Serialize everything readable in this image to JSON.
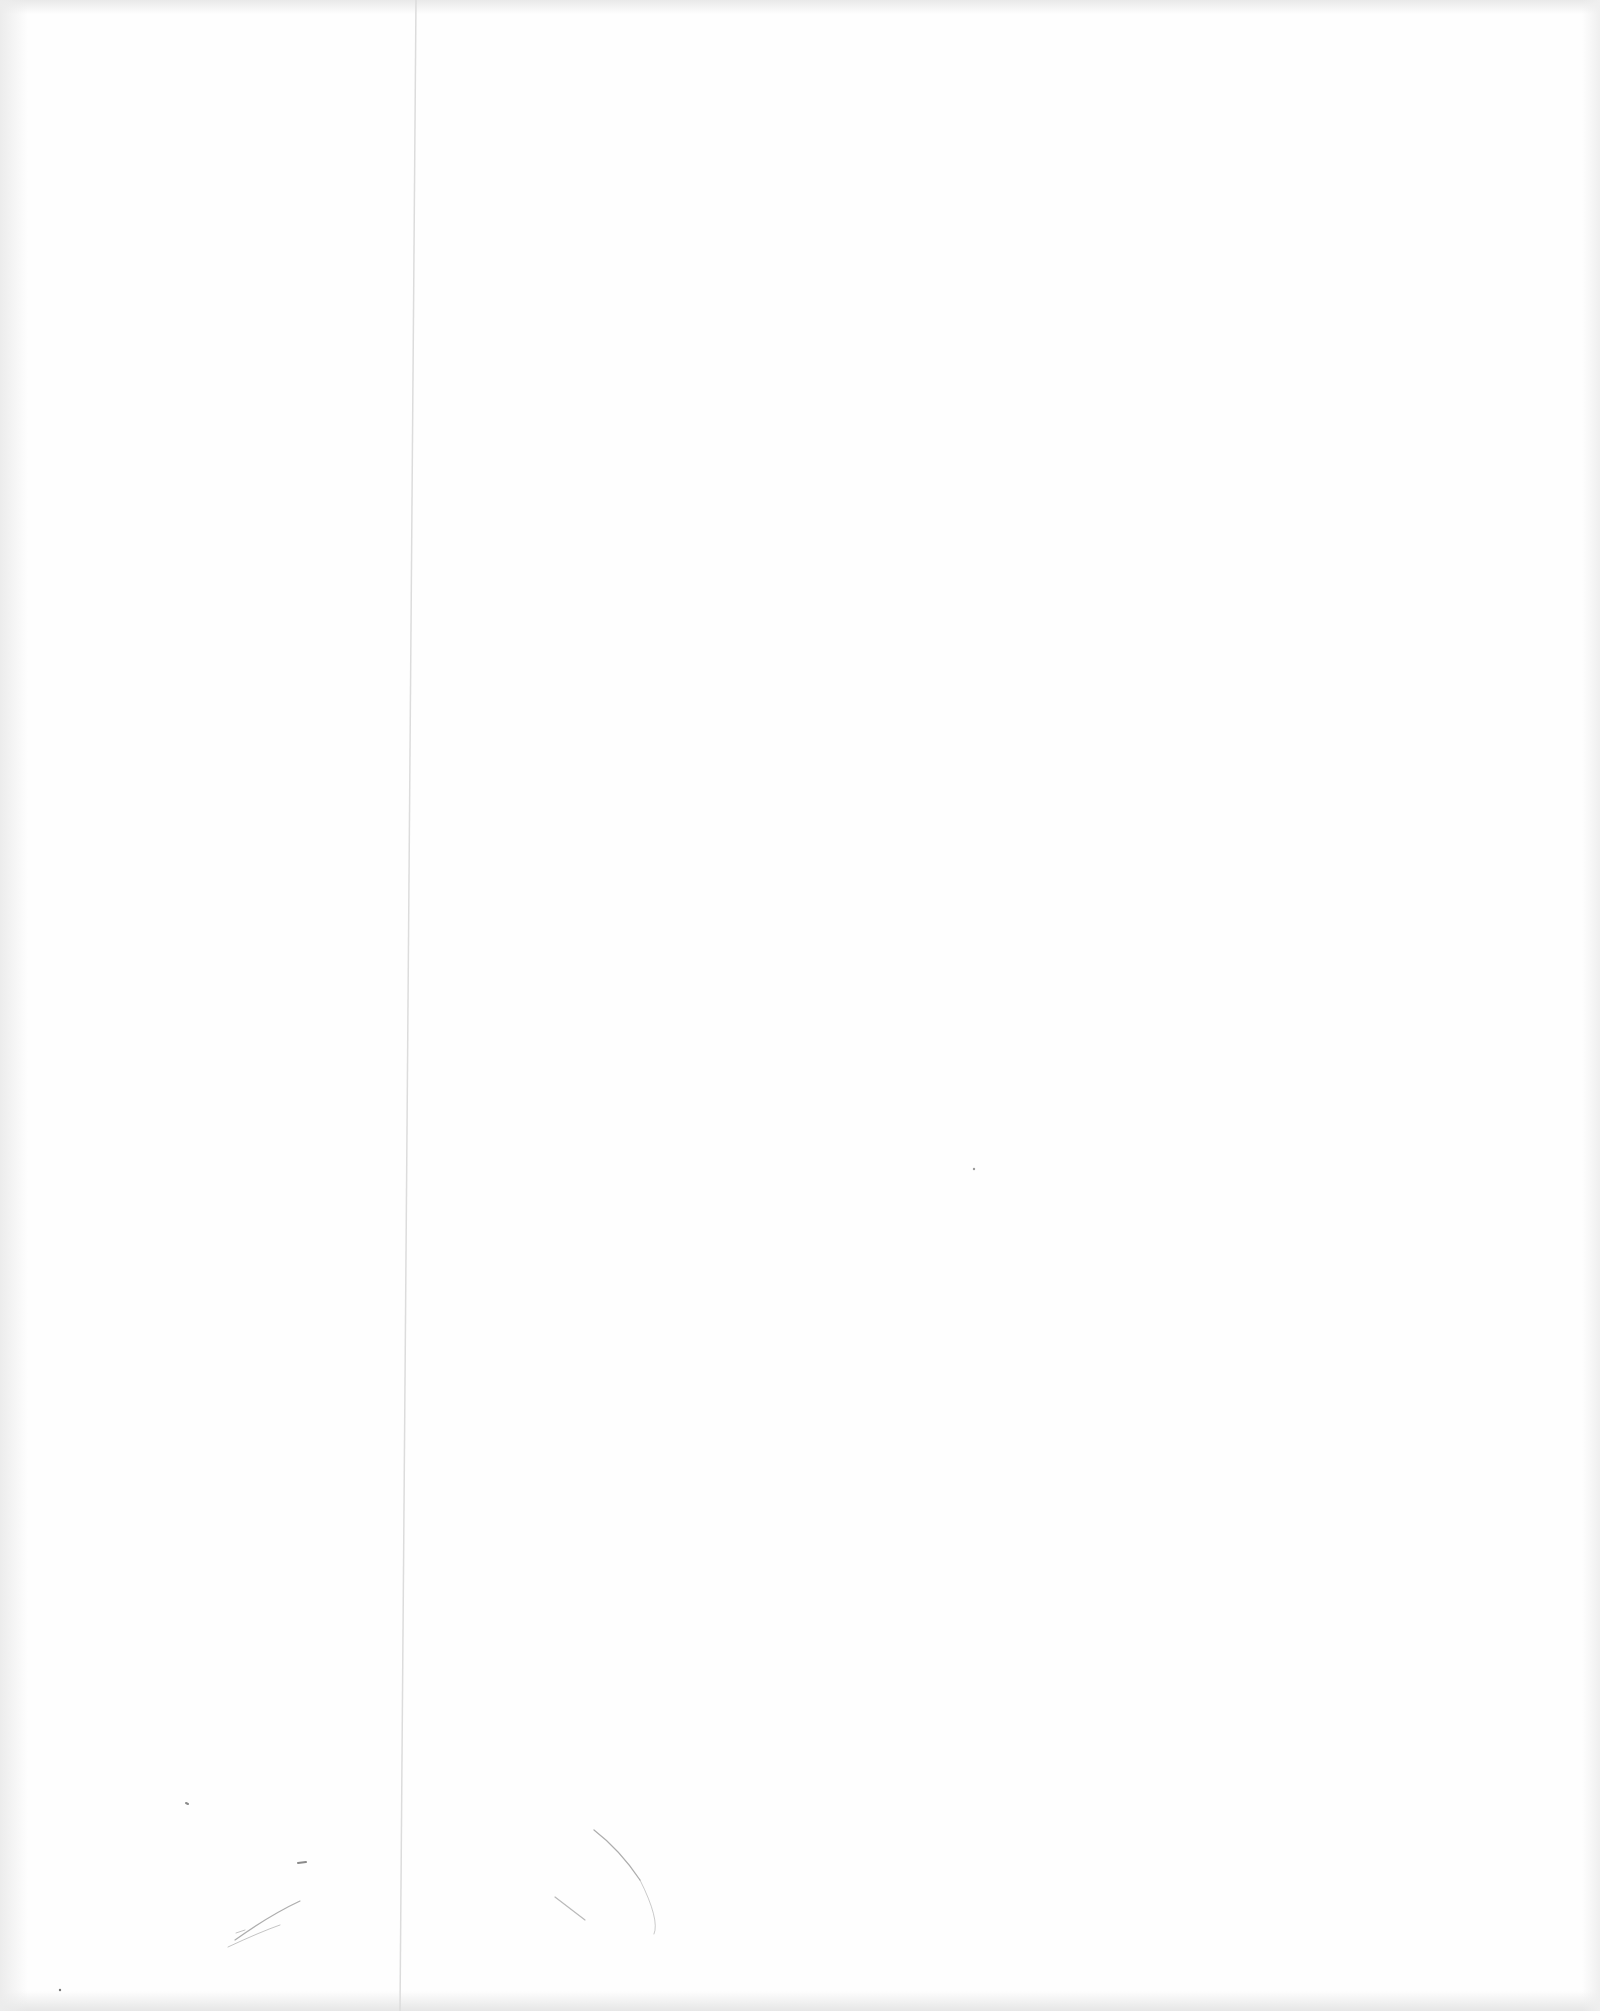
{
  "document": {
    "type": "blank scanned page",
    "text_content": "",
    "features": {
      "fold_line": {
        "color": "#d8d8d8"
      },
      "scan_edge_shading": {
        "color": "#e8e8e8"
      },
      "stray_marks": {
        "color": "#8a8a8a"
      }
    }
  }
}
